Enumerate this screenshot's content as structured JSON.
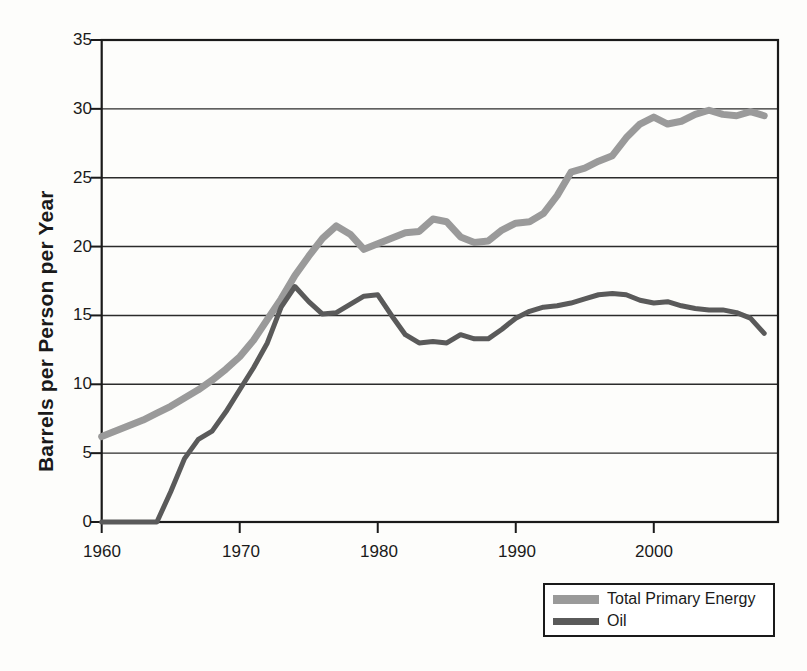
{
  "chart_data": {
    "type": "line",
    "title": "",
    "xlabel": "",
    "ylabel": "Barrels per Person per Year",
    "xlim": [
      1960,
      2009
    ],
    "ylim": [
      0,
      35
    ],
    "xticks": [
      1960,
      1970,
      1980,
      1990,
      2000
    ],
    "yticks": [
      0,
      5,
      10,
      15,
      20,
      25,
      30,
      35
    ],
    "grid": true,
    "grid_axis": "y",
    "legend_position": "bottom-right",
    "x": [
      1960,
      1961,
      1962,
      1963,
      1964,
      1965,
      1966,
      1967,
      1968,
      1969,
      1970,
      1971,
      1972,
      1973,
      1974,
      1975,
      1976,
      1977,
      1978,
      1979,
      1980,
      1981,
      1982,
      1983,
      1984,
      1985,
      1986,
      1987,
      1988,
      1989,
      1990,
      1991,
      1992,
      1993,
      1994,
      1995,
      1996,
      1997,
      1998,
      1999,
      2000,
      2001,
      2002,
      2003,
      2004,
      2005,
      2006,
      2007,
      2008
    ],
    "series": [
      {
        "name": "Total Primary Energy",
        "color": "#9a9a9a",
        "linewidth": 7,
        "values": [
          6.2,
          6.6,
          7.0,
          7.4,
          7.9,
          8.4,
          9.0,
          9.6,
          10.3,
          11.1,
          12.0,
          13.2,
          14.7,
          16.2,
          17.9,
          19.3,
          20.6,
          21.5,
          20.9,
          19.8,
          20.2,
          20.6,
          21.0,
          21.1,
          22.0,
          21.8,
          20.7,
          20.3,
          20.4,
          21.2,
          21.7,
          21.8,
          22.4,
          23.7,
          25.4,
          25.7,
          26.2,
          26.6,
          27.9,
          28.9,
          29.4,
          28.9,
          29.1,
          29.6,
          29.9,
          29.6,
          29.5,
          29.8,
          29.5
        ]
      },
      {
        "name": "Oil",
        "color": "#5a5a5a",
        "linewidth": 5,
        "values": [
          0.0,
          0.0,
          0.0,
          0.0,
          0.0,
          2.2,
          4.6,
          6.0,
          6.6,
          8.0,
          9.6,
          11.2,
          13.0,
          15.6,
          17.1,
          16.0,
          15.1,
          15.2,
          15.8,
          16.4,
          16.5,
          15.0,
          13.6,
          13.0,
          13.1,
          13.0,
          13.6,
          13.3,
          13.3,
          14.0,
          14.8,
          15.3,
          15.6,
          15.7,
          15.9,
          16.2,
          16.5,
          16.6,
          16.5,
          16.1,
          15.9,
          16.0,
          15.7,
          15.5,
          15.4,
          15.4,
          15.2,
          14.8,
          13.7
        ]
      }
    ]
  },
  "axes": {
    "y_title": "Barrels per Person per Year",
    "y_tick_labels": [
      "35",
      "30",
      "25",
      "20",
      "15",
      "10",
      "5",
      "0"
    ],
    "x_tick_labels": [
      "1960",
      "1970",
      "1980",
      "1990",
      "2000"
    ]
  },
  "legend": {
    "entries": [
      {
        "label": "Total Primary Energy",
        "color": "#9a9a9a",
        "swatch_height": 9
      },
      {
        "label": "Oil",
        "color": "#5a5a5a",
        "swatch_height": 7
      }
    ]
  },
  "colors": {
    "background": "#fdfdfb",
    "plot_background": "#ffffff",
    "axis": "#1a1a1a",
    "gridline": "#2b2b2b",
    "total_primary_energy": "#9a9a9a",
    "oil": "#5a5a5a"
  }
}
